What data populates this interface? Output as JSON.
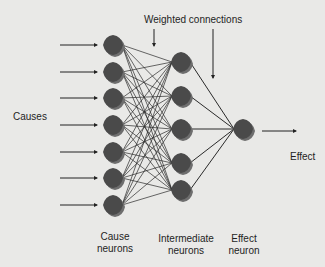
{
  "diagram": {
    "title_label": "Weighted connections",
    "labels": {
      "causes": "Causes",
      "effect": "Effect",
      "cause_neurons_line1": "Cause",
      "cause_neurons_line2": "neurons",
      "intermediate_neurons_line1": "Intermediate",
      "intermediate_neurons_line2": "neurons",
      "effect_neuron_line1": "Effect",
      "effect_neuron_line2": "neuron"
    },
    "layers": [
      {
        "name": "Cause neurons",
        "count": 7
      },
      {
        "name": "Intermediate neurons",
        "count": 5
      },
      {
        "name": "Effect neuron",
        "count": 1
      }
    ],
    "colors": {
      "background": "#e9e9e7",
      "node": "#4a4a4a",
      "node_shadow": "#6e6e6e",
      "line": "#2a2a2a"
    }
  }
}
